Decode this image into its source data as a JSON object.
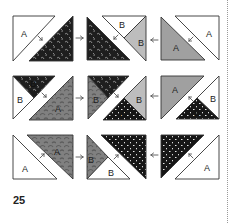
{
  "page": {
    "number": "25"
  },
  "colors": {
    "outline": "#333333",
    "white": "#ffffff",
    "light_gray": "#bdbdbd",
    "mid_gray": "#9a9a9a",
    "gray_print": "#7d7d7d",
    "dark_print": "#2a2a2a",
    "speckle": "#1c1c1c",
    "arrow": "#555555"
  },
  "labels": {
    "A": "A",
    "B": "B"
  },
  "rows": [
    {
      "blocks": [
        {
          "pieces": [
            {
              "label": "A",
              "fill": "white"
            },
            {
              "label": "",
              "fill": "dark_print"
            }
          ]
        },
        {
          "pieces": [
            {
              "label": "",
              "fill": "dark_print"
            },
            {
              "label": "B",
              "fill": "white"
            },
            {
              "label": "B",
              "fill": "light_gray"
            }
          ]
        },
        {
          "pieces": [
            {
              "label": "A",
              "fill": "mid_gray"
            },
            {
              "label": "A",
              "fill": "white"
            }
          ]
        }
      ],
      "arrows_between": [
        "right",
        "left"
      ]
    },
    {
      "blocks": [
        {
          "pieces": [
            {
              "label": "B",
              "fill": "dark_print"
            },
            {
              "label": "B",
              "fill": "white"
            },
            {
              "label": "A",
              "fill": "gray_print"
            }
          ]
        },
        {
          "pieces": [
            {
              "label": "",
              "fill": "dark_print"
            },
            {
              "label": "B",
              "fill": "gray_print"
            },
            {
              "label": "B",
              "fill": "light_gray"
            },
            {
              "label": "B",
              "fill": "speckle"
            }
          ]
        },
        {
          "pieces": [
            {
              "label": "A",
              "fill": "mid_gray"
            },
            {
              "label": "B",
              "fill": "white"
            },
            {
              "label": "B",
              "fill": "speckle"
            }
          ]
        }
      ],
      "arrows_between": [
        "right",
        "left"
      ]
    },
    {
      "blocks": [
        {
          "pieces": [
            {
              "label": "A",
              "fill": "white"
            },
            {
              "label": "A",
              "fill": "gray_print"
            }
          ]
        },
        {
          "pieces": [
            {
              "label": "B",
              "fill": "gray_print"
            },
            {
              "label": "B",
              "fill": "white"
            },
            {
              "label": "",
              "fill": "speckle"
            }
          ]
        },
        {
          "pieces": [
            {
              "label": "",
              "fill": "speckle"
            },
            {
              "label": "A",
              "fill": "white"
            }
          ]
        }
      ],
      "arrows_between": [
        "right",
        "left"
      ]
    }
  ]
}
